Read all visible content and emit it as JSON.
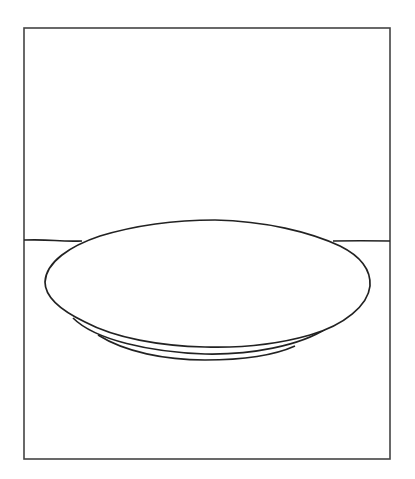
{
  "scene": {
    "subject": "plate-on-table-line-drawing",
    "stroke_color": "#222222",
    "frame_color": "#444444",
    "background": "#ffffff",
    "frame": {
      "x": 24,
      "y": 28,
      "width": 366,
      "height": 431
    },
    "table_edge": {
      "left": {
        "x1": 24,
        "y1": 240,
        "x2": 82,
        "y2": 241
      },
      "right": {
        "x1": 333,
        "y1": 241,
        "x2": 390,
        "y2": 241
      }
    },
    "plate_rim": {
      "cx": 208,
      "cy": 283,
      "rx": 163,
      "ry": 64
    }
  }
}
